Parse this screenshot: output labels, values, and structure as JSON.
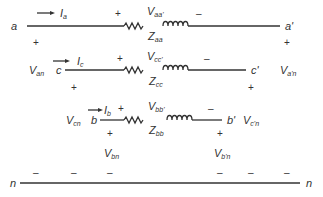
{
  "diagram": {
    "nodes": {
      "a": "a",
      "a_prime": "a'",
      "c": "c",
      "c_prime": "c'",
      "b": "b",
      "b_prime": "b'",
      "n_left": "n",
      "n_right": "n"
    },
    "currents": {
      "Ia": {
        "base": "I",
        "sub": "a"
      },
      "Ic": {
        "base": "I",
        "sub": "c"
      },
      "Ib": {
        "base": "I",
        "sub": "b"
      }
    },
    "drop_voltages": {
      "Vaa": {
        "base": "V",
        "sub": "aa'"
      },
      "Vcc": {
        "base": "V",
        "sub": "cc'"
      },
      "Vbb": {
        "base": "V",
        "sub": "bb'"
      }
    },
    "impedances": {
      "Zaa": {
        "base": "Z",
        "sub": "aa"
      },
      "Zcc": {
        "base": "Z",
        "sub": "cc"
      },
      "Zbb": {
        "base": "Z",
        "sub": "bb"
      }
    },
    "source_voltages": {
      "Van": {
        "base": "V",
        "sub": "an"
      },
      "Vcn": {
        "base": "V",
        "sub": "cn"
      },
      "Vbn": {
        "base": "V",
        "sub": "bn"
      }
    },
    "load_voltages": {
      "Van_p": {
        "base": "V",
        "sub": "a'n"
      },
      "Vcn_p": {
        "base": "V",
        "sub": "c'n"
      },
      "Vbn_p": {
        "base": "V",
        "sub": "b'n"
      }
    },
    "signs": {
      "plus": "+",
      "minus": "–"
    },
    "line_color": "#333333"
  }
}
